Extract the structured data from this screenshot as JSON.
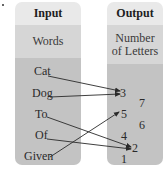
{
  "diagram": {
    "type": "function-mapping",
    "input": {
      "header": "Input",
      "subheader": "Words",
      "items": [
        "Cat",
        "Dog",
        "To",
        "Of",
        "Given"
      ]
    },
    "output": {
      "header": "Output",
      "subheader_line1": "Number",
      "subheader_line2": "of Letters",
      "items": [
        "3",
        "7",
        "5",
        "6",
        "4",
        "2",
        "1"
      ]
    },
    "mappings": [
      {
        "from": "Cat",
        "to": "3"
      },
      {
        "from": "Dog",
        "to": "3"
      },
      {
        "from": "To",
        "to": "2"
      },
      {
        "from": "Of",
        "to": "2"
      },
      {
        "from": "Given",
        "to": "5"
      }
    ],
    "colors": {
      "header_band": "#e9e9e9",
      "subheader_band": "#d6d6d6",
      "content_band": "#c3c3c3",
      "arrow": "#2a2a2a"
    }
  }
}
